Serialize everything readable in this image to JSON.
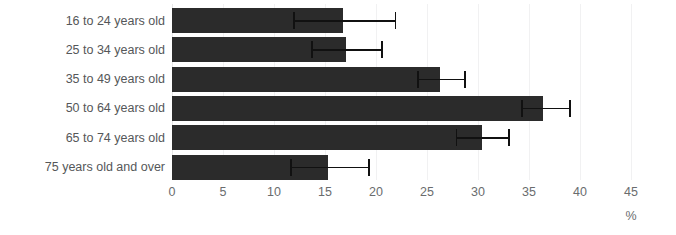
{
  "chart_data": {
    "type": "bar",
    "orientation": "horizontal",
    "title": "",
    "xlabel": "%",
    "ylabel": "",
    "xlim": [
      0,
      45
    ],
    "xticks": [
      0,
      5,
      10,
      15,
      20,
      25,
      30,
      35,
      40,
      45
    ],
    "xtick_labels": [
      "0",
      "5",
      "10",
      "15",
      "20",
      "25",
      "30",
      "35",
      "40",
      "45"
    ],
    "grid": true,
    "legend": false,
    "categories": [
      "16 to 24 years old",
      "25 to 34 years old",
      "35 to 49 years old",
      "50 to 64 years old",
      "65 to 74 years old",
      "75 years old and over"
    ],
    "values": [
      16.8,
      17.1,
      26.3,
      36.4,
      30.4,
      15.3
    ],
    "error_low": [
      11.9,
      13.6,
      24.0,
      34.2,
      27.8,
      11.6
    ],
    "error_high": [
      22.0,
      20.7,
      28.8,
      39.1,
      33.1,
      19.4
    ],
    "bar_color": "#2b2b2b",
    "error_color": "#111111",
    "grid_color": "#f1f1f2",
    "label_color": "#555759",
    "tick_color": "#6a6c6e",
    "background_color": "#ffffff"
  }
}
